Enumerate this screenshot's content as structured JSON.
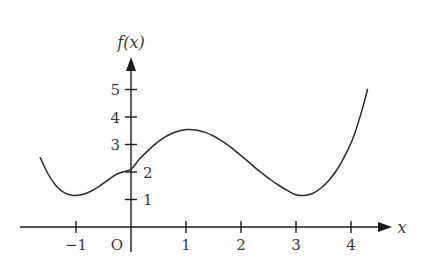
{
  "chart_data": {
    "type": "line",
    "title": "",
    "xlabel": "x",
    "ylabel": "f(x)",
    "xlim": [
      -1.65,
      4.3
    ],
    "ylim": [
      0,
      5.6
    ],
    "grid": false,
    "legend": "none",
    "x_ticks": [
      -1,
      0,
      1,
      2,
      3,
      4
    ],
    "x_tick_labels": [
      "−1",
      "0",
      "1",
      "2",
      "3",
      "4"
    ],
    "y_ticks": [
      1,
      2,
      3,
      4,
      5
    ],
    "y_tick_labels": [
      "1",
      "2",
      "3",
      "4",
      "5"
    ],
    "origin_label": "O",
    "annotations": {
      "local_max": {
        "x": 1,
        "y": 3.55
      },
      "local_min_left": {
        "x": -1,
        "y": 1.15
      },
      "local_min_right": {
        "x": 3,
        "y": 1.15
      },
      "y_intercept": {
        "x": 0,
        "y": 2.1
      }
    },
    "series": [
      {
        "name": "f(x)",
        "color": "#2a2a2a",
        "x": [
          -1.65,
          -1.5,
          -1.35,
          -1.2,
          -1.05,
          -0.9,
          -0.75,
          -0.6,
          -0.45,
          -0.3,
          -0.15,
          0,
          0.15,
          0.3,
          0.45,
          0.6,
          0.75,
          0.9,
          1.05,
          1.2,
          1.35,
          1.5,
          1.65,
          1.8,
          1.95,
          2.1,
          2.25,
          2.4,
          2.55,
          2.7,
          2.85,
          3,
          3.15,
          3.3,
          3.45,
          3.6,
          3.75,
          3.9,
          4.05,
          4.2,
          4.3
        ],
        "y": [
          2.52,
          1.9,
          1.47,
          1.23,
          1.15,
          1.17,
          1.28,
          1.45,
          1.66,
          1.88,
          2.0,
          2.1,
          2.46,
          2.76,
          3.03,
          3.25,
          3.41,
          3.51,
          3.55,
          3.52,
          3.44,
          3.31,
          3.13,
          2.92,
          2.68,
          2.43,
          2.17,
          1.93,
          1.7,
          1.5,
          1.32,
          1.17,
          1.15,
          1.22,
          1.41,
          1.7,
          2.1,
          2.63,
          3.3,
          4.25,
          5.0
        ]
      }
    ]
  },
  "figure": {
    "axis_color": "#1c1c1c",
    "curve_color": "#2a2a2a",
    "background": "#ffffff"
  }
}
